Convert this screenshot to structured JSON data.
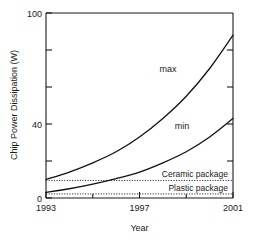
{
  "chart_data": {
    "type": "line",
    "title": "",
    "xlabel": "Year",
    "ylabel": "Chip Power Dissipation (W)",
    "xlim": [
      1993,
      2001
    ],
    "ylim": [
      0,
      100
    ],
    "xticks": [
      1993,
      1997,
      2001
    ],
    "xtick_labels": [
      "1993",
      "1997",
      "2001"
    ],
    "yticks": [
      0,
      20,
      40,
      60,
      80,
      100
    ],
    "ytick_labels": [
      "0",
      "",
      "40",
      "",
      "",
      "100"
    ],
    "ytick_labels_shown": [
      "0",
      "40",
      "100"
    ],
    "grid": false,
    "legend": "inline-labels",
    "series": [
      {
        "name": "max",
        "label": "max",
        "x": [
          1993,
          1994,
          1995,
          1996,
          1997,
          1998,
          1999,
          2000,
          2001
        ],
        "values": [
          10,
          14,
          19,
          25,
          33,
          43,
          55,
          70,
          88
        ]
      },
      {
        "name": "min",
        "label": "min",
        "x": [
          1993,
          1994,
          1995,
          1996,
          1997,
          1998,
          1999,
          2000,
          2001
        ],
        "values": [
          3,
          5,
          7.5,
          10.5,
          14,
          19,
          25,
          33,
          43
        ]
      }
    ],
    "annotations": [
      {
        "name": "ceramic-package",
        "label": "Ceramic package",
        "type": "hline",
        "value": 9.5,
        "style": "dotted"
      },
      {
        "name": "plastic-package",
        "label": "Plastic package",
        "type": "hline",
        "value": 2.2,
        "style": "dotted"
      }
    ]
  },
  "axes": {
    "y_title": "Chip Power Dissipation (W)",
    "x_title": "Year",
    "y_top_label": "100",
    "y_mid_label": "40",
    "y_bottom_label": "0",
    "x_left_label": "1993",
    "x_mid_label": "1997",
    "x_right_label": "2001"
  },
  "series_labels": {
    "max": "max",
    "min": "min"
  },
  "annotation_labels": {
    "ceramic": "Ceramic package",
    "plastic": "Plastic package"
  },
  "colors": {
    "background": "#ffffff",
    "ink": "#1a1a1a",
    "curve": "#111111",
    "threshold": "#333333"
  }
}
